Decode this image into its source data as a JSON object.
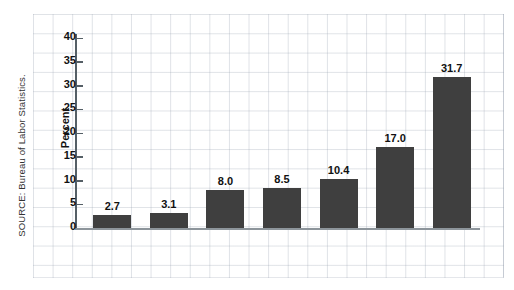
{
  "source_note": "SOURCE: Bureau of Labor Statistics.",
  "chart_data": {
    "type": "bar",
    "title": "",
    "xlabel": "",
    "ylabel": "Percent",
    "ylim": [
      0,
      40
    ],
    "yticks": [
      0,
      5,
      10,
      15,
      20,
      25,
      30,
      35,
      40
    ],
    "grid": true,
    "legend": "none",
    "bar_color": "#3f3f3f",
    "categories": [
      "College Graduates",
      "Married Men",
      "Women Who Maintain Families",
      "Adults Who Did Not Graduate from High School",
      "Blacks",
      "Teenagers",
      "Black Male Teenagers"
    ],
    "category_lines": [
      [
        "College",
        "Graduates"
      ],
      [
        "Married",
        "Men"
      ],
      [
        "Women",
        "Who",
        "Maintain",
        "Families"
      ],
      [
        "Adults",
        "Who Did Not",
        "Graduate from",
        "High School"
      ],
      [
        "Blacks"
      ],
      [
        "Teenagers"
      ],
      [
        "Black",
        "Male",
        "Teenagers"
      ]
    ],
    "values": [
      2.7,
      3.1,
      8.0,
      8.5,
      10.4,
      17.0,
      31.7
    ],
    "value_labels": [
      "2.7",
      "3.1",
      "8.0",
      "8.5",
      "10.4",
      "17.0",
      "31.7"
    ]
  }
}
